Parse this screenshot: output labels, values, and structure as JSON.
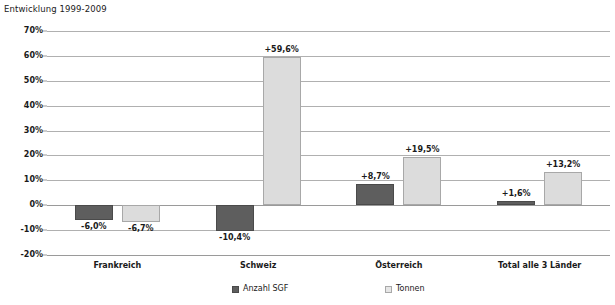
{
  "chart_data": {
    "type": "bar",
    "title": "Entwicklung 1999-2009",
    "xlabel": "",
    "ylabel": "",
    "ylim": [
      -20,
      70
    ],
    "ytick_step": 10,
    "grid": true,
    "legend_position": "bottom",
    "categories": [
      "Frankreich",
      "Schweiz",
      "Österreich",
      "Total alle 3 Länder"
    ],
    "ytick_labels": [
      "70%",
      "60%",
      "50%",
      "40%",
      "30%",
      "20%",
      "10%",
      "0%",
      "-10%",
      "-20%"
    ],
    "ytick_values": [
      70,
      60,
      50,
      40,
      30,
      20,
      10,
      0,
      -10,
      -20
    ],
    "series": [
      {
        "name": "Anzahl SGF",
        "color": "#5e5e5e",
        "values": [
          -6.0,
          -10.4,
          8.7,
          1.6
        ],
        "labels": [
          "-6,0%",
          "-10,4%",
          "+8,7%",
          "+1,6%"
        ]
      },
      {
        "name": "Tonnen",
        "color": "#dcdcdc",
        "values": [
          -6.7,
          59.6,
          19.5,
          13.2
        ],
        "labels": [
          "-6,7%",
          "+59,6%",
          "+19,5%",
          "+13,2%"
        ]
      }
    ]
  },
  "colors": {
    "series_0": "#5e5e5e",
    "series_1": "#dcdcdc",
    "gridline": "#b0b0b0",
    "axis": "#9a9a9a",
    "text": "#1a1a1a",
    "background": "#ffffff"
  }
}
